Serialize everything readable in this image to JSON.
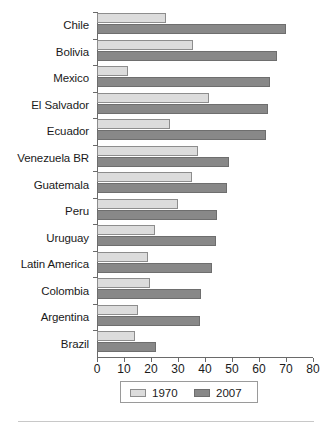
{
  "chart_data": {
    "type": "bar",
    "orientation": "horizontal",
    "title": "",
    "subtitle": "",
    "xlabel": "",
    "ylabel": "",
    "xlim": [
      0,
      80
    ],
    "xticks": [
      0,
      10,
      20,
      30,
      40,
      50,
      60,
      70,
      80
    ],
    "xtick_labels": [
      "0",
      "10",
      "20",
      "30",
      "40",
      "50",
      "60",
      "70",
      "80"
    ],
    "grid": false,
    "legend_position": "bottom-center",
    "categories": [
      "Chile",
      "Bolivia",
      "Mexico",
      "El Salvador",
      "Ecuador",
      "Venezuela BR",
      "Guatemala",
      "Peru",
      "Uruguay",
      "Latin America",
      "Colombia",
      "Argentina",
      "Brazil"
    ],
    "series": [
      {
        "name": "1970",
        "color": "#dcdcdc",
        "values": [
          25.5,
          35.5,
          11.5,
          41.5,
          27.0,
          37.5,
          35.0,
          30.0,
          21.5,
          19.0,
          19.5,
          15.0,
          14.0
        ]
      },
      {
        "name": "2007",
        "color": "#888888",
        "values": [
          70.0,
          66.5,
          64.0,
          63.5,
          62.5,
          49.0,
          48.0,
          44.5,
          44.0,
          42.5,
          38.5,
          38.0,
          22.0
        ]
      }
    ]
  },
  "legend": {
    "items": [
      {
        "label": "1970",
        "color": "#dcdcdc"
      },
      {
        "label": "2007",
        "color": "#888888"
      }
    ]
  }
}
